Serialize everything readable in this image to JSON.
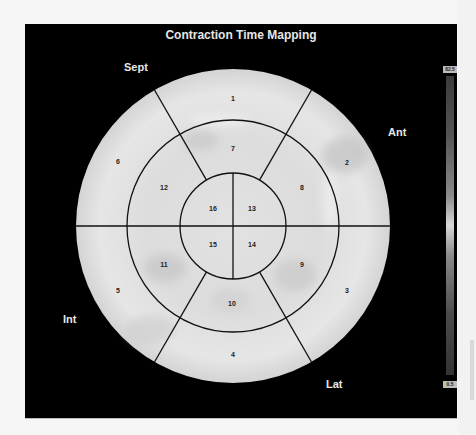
{
  "title": "Contraction Time Mapping",
  "orientation_labels": {
    "top_left": "Sept",
    "right": "Ant",
    "left": "Int",
    "bottom_right": "Lat"
  },
  "segments": {
    "basal": [
      "1",
      "2",
      "3",
      "4",
      "5",
      "6"
    ],
    "mid": [
      "7",
      "8",
      "9",
      "10",
      "11",
      "12"
    ],
    "apical": [
      "13",
      "14",
      "15",
      "16"
    ]
  },
  "scale": {
    "max_label": "82.5",
    "min_label": "0.5"
  },
  "colors": {
    "background": "#000000",
    "map_fill": "#e4e4e4",
    "grid_lines": "#111111",
    "label_text": "#e8e8e8"
  }
}
